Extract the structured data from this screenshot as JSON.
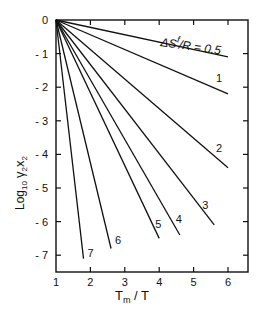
{
  "chart_data": {
    "type": "line",
    "title": "",
    "xlabel": "Tm / T",
    "ylabel": "Log10 γ2x2",
    "xlim": [
      1,
      6.5
    ],
    "ylim": [
      -7.5,
      0
    ],
    "xticks": [
      "1",
      "2",
      "3",
      "4",
      "5",
      "6"
    ],
    "yticks": [
      "0",
      "-1",
      "-2",
      "-3",
      "-4",
      "-5",
      "-6",
      "-7"
    ],
    "legend_annotation": "ΔSf/R = 0.5",
    "series": [
      {
        "name": "0.5",
        "x": [
          1,
          6.0
        ],
        "y": [
          0,
          -1.1
        ]
      },
      {
        "name": "1",
        "x": [
          1,
          6.0
        ],
        "y": [
          0,
          -2.2
        ]
      },
      {
        "name": "2",
        "x": [
          1,
          6.0
        ],
        "y": [
          0,
          -4.4
        ]
      },
      {
        "name": "3",
        "x": [
          1,
          5.6
        ],
        "y": [
          0,
          -6.1
        ]
      },
      {
        "name": "4",
        "x": [
          1,
          4.6
        ],
        "y": [
          0,
          -6.4
        ]
      },
      {
        "name": "5",
        "x": [
          1,
          4.0
        ],
        "y": [
          0,
          -6.5
        ]
      },
      {
        "name": "6",
        "x": [
          1,
          2.6
        ],
        "y": [
          0,
          -6.8
        ]
      },
      {
        "name": "7",
        "x": [
          1,
          1.8
        ],
        "y": [
          0,
          -7.1
        ]
      }
    ],
    "grid": false
  },
  "labels": {
    "xlabel_main": "T",
    "xlabel_sub": "m",
    "xlabel_rest": " / T",
    "ylabel_log": "Log",
    "ylabel_base": "10",
    "ylabel_gamma": "γ",
    "ylabel_sub1": "2",
    "ylabel_x": "x",
    "ylabel_sub2": "2",
    "annot_delta": "ΔS",
    "annot_sup": "f",
    "annot_rest": "/R = 0.5",
    "curve_labels": [
      "1",
      "2",
      "3",
      "4",
      "5",
      "6",
      "7"
    ]
  }
}
